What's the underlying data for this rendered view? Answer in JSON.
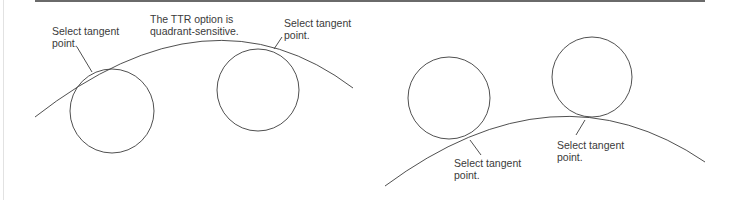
{
  "figure": {
    "stroke_color": "#3c3c3c",
    "left_panel": {
      "callouts": [
        {
          "id": "left-tangent-1",
          "text": "Select tangent\npoint."
        },
        {
          "id": "ttr-note",
          "text": "The TTR option is\nquadrant-sensitive."
        },
        {
          "id": "left-tangent-2",
          "text": "Select tangent\npoint."
        }
      ]
    },
    "right_panel": {
      "callouts": [
        {
          "id": "right-tangent-1",
          "text": "Select tangent\npoint."
        },
        {
          "id": "right-tangent-2",
          "text": "Select tangent\npoint."
        }
      ]
    }
  }
}
